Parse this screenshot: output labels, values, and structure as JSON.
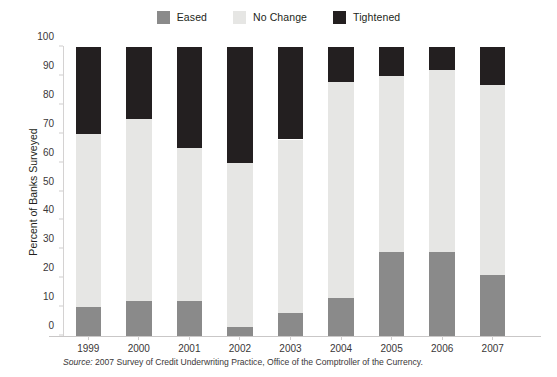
{
  "legend": {
    "position": "top-center",
    "items": [
      {
        "label": "Eased",
        "color": "#8a8a8a",
        "name": "eased"
      },
      {
        "label": "No Change",
        "color": "#e6e6e4",
        "name": "no-change"
      },
      {
        "label": "Tightened",
        "color": "#231f20",
        "name": "tightened"
      }
    ]
  },
  "axes": {
    "ylabel": "Percent of Banks Surveyed",
    "yticks": [
      0,
      10,
      20,
      30,
      40,
      50,
      60,
      70,
      80,
      90,
      100
    ],
    "ylim": [
      0,
      100
    ]
  },
  "source": {
    "lead": "Source:",
    "text": " 2007 Survey of Credit Underwriting Practice, Office of the Comptroller of the Currency."
  },
  "chart_data": {
    "type": "bar",
    "subtype": "stacked-100-percent",
    "title": "",
    "xlabel": "",
    "ylabel": "Percent of Banks Surveyed",
    "ylim": [
      0,
      100
    ],
    "grid": false,
    "legend_position": "top-center",
    "categories": [
      "1999",
      "2000",
      "2001",
      "2002",
      "2003",
      "2004",
      "2005",
      "2006",
      "2007"
    ],
    "series": [
      {
        "name": "Eased",
        "color": "#8a8a8a",
        "values": [
          10,
          12,
          12,
          3,
          8,
          13,
          29,
          29,
          21
        ]
      },
      {
        "name": "No Change",
        "color": "#e6e6e4",
        "values": [
          60,
          63,
          53,
          57,
          60,
          75,
          61,
          63,
          66
        ]
      },
      {
        "name": "Tightened",
        "color": "#231f20",
        "values": [
          30,
          25,
          35,
          40,
          32,
          12,
          10,
          8,
          13
        ]
      }
    ]
  }
}
